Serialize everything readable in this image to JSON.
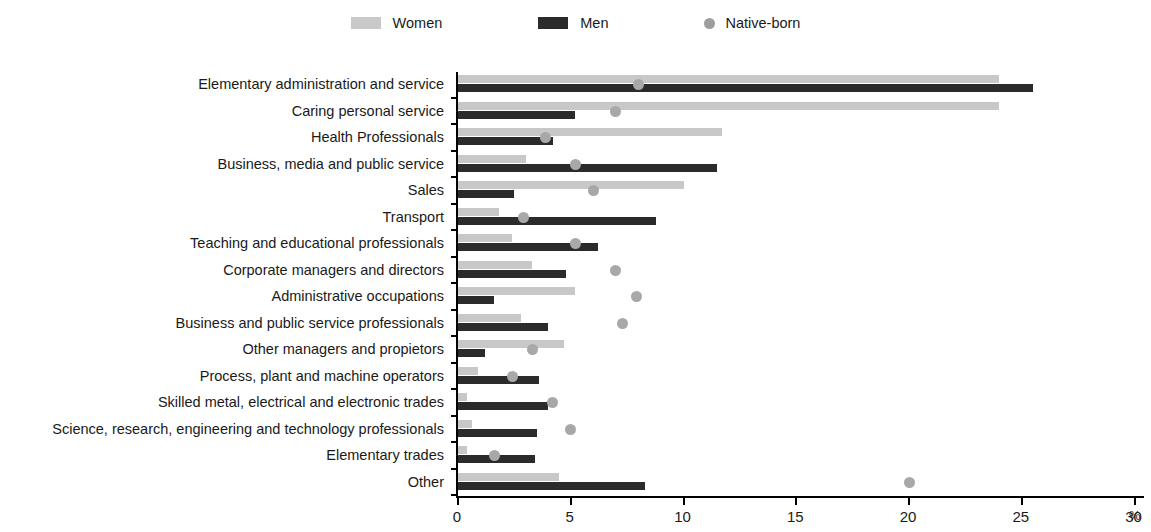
{
  "legend": {
    "items": [
      {
        "label": "Women",
        "type": "swatch",
        "color": "#c9c9c9",
        "icon": "legend-swatch-women"
      },
      {
        "label": "Men",
        "type": "swatch",
        "color": "#2b2b2b",
        "icon": "legend-swatch-men"
      },
      {
        "label": "Native-born",
        "type": "dot",
        "color": "#9e9e9e",
        "icon": "legend-dot-native-born"
      }
    ]
  },
  "axis": {
    "x_ticks": [
      "0",
      "5",
      "10",
      "15",
      "20",
      "25",
      "30"
    ],
    "x_unit": "%"
  },
  "chart_data": {
    "type": "bar",
    "orientation": "horizontal",
    "title": "",
    "xlabel": "%",
    "ylabel": "",
    "xlim": [
      0,
      30
    ],
    "grid": false,
    "legend_position": "top-center",
    "categories": [
      "Elementary administration and service",
      "Caring personal service",
      "Health Professionals",
      "Business, media and public service",
      "Sales",
      "Transport",
      "Teaching and educational professionals",
      "Corporate managers and directors",
      "Administrative occupations",
      "Business and public service professionals",
      "Other managers and propietors",
      "Process, plant and machine operators",
      "Skilled metal, electrical and electronic trades",
      "Science, research, engineering and technology professionals",
      "Elementary trades",
      "Other"
    ],
    "series": [
      {
        "name": "Women",
        "type": "bar",
        "color": "#c8c8c8",
        "values": [
          24.0,
          24.0,
          11.7,
          3.0,
          10.0,
          1.8,
          2.4,
          3.3,
          5.2,
          2.8,
          4.7,
          0.9,
          0.4,
          0.6,
          0.4,
          4.5
        ]
      },
      {
        "name": "Men",
        "type": "bar",
        "color": "#2b2b2b",
        "values": [
          25.5,
          5.2,
          4.2,
          11.5,
          2.5,
          8.8,
          6.2,
          4.8,
          1.6,
          4.0,
          1.2,
          3.6,
          4.0,
          3.5,
          3.4,
          8.3
        ]
      },
      {
        "name": "Native-born",
        "type": "scatter",
        "color": "#a8a8a8",
        "values": [
          8.0,
          7.0,
          3.9,
          5.2,
          6.0,
          2.9,
          5.2,
          7.0,
          7.9,
          7.3,
          3.3,
          2.4,
          4.2,
          5.0,
          1.6,
          20.0
        ]
      }
    ]
  }
}
